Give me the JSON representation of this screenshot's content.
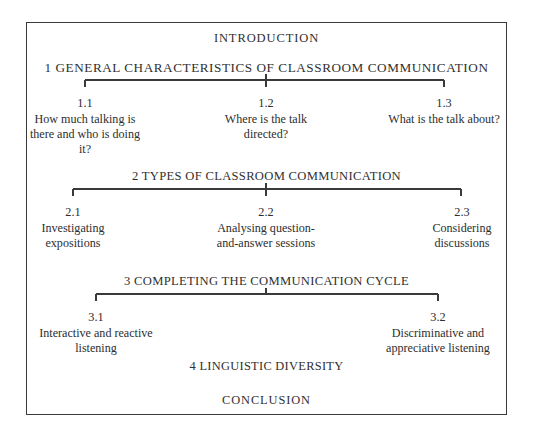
{
  "document": {
    "type": "book-structure-diagram",
    "border_color": "#3a3a3a",
    "text_color": "#2e2e2e",
    "background": "#ffffff"
  },
  "headings": {
    "introduction": "INTRODUCTION",
    "section_1": "1  GENERAL  CHARACTERISTICS  OF  CLASSROOM  COMMUNICATION",
    "section_2": "2  TYPES OF CLASSROOM COMMUNICATION",
    "section_3": "3  COMPLETING THE COMMUNICATION CYCLE",
    "section_4": "4  LINGUISTIC DIVERSITY",
    "conclusion": "CONCLUSION"
  },
  "groups": [
    {
      "id": "group-1",
      "nodes": [
        {
          "number": "1.1",
          "label": "How much talking is there and who is doing it?"
        },
        {
          "number": "1.2",
          "label": "Where is the talk directed?"
        },
        {
          "number": "1.3",
          "label": "What is the talk about?"
        }
      ]
    },
    {
      "id": "group-2",
      "nodes": [
        {
          "number": "2.1",
          "label": "Investigating expositions"
        },
        {
          "number": "2.2",
          "label": "Analysing question-and-answer sessions"
        },
        {
          "number": "2.3",
          "label": "Considering discussions"
        }
      ]
    },
    {
      "id": "group-3",
      "nodes": [
        {
          "number": "3.1",
          "label": "Interactive and reactive listening"
        },
        {
          "number": "3.2",
          "label": "Discriminative and appreciative listening"
        }
      ]
    }
  ]
}
